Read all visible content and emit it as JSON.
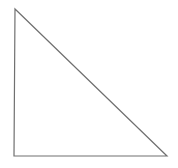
{
  "diagram": {
    "shape": "right-triangle",
    "stroke_color": "#707070",
    "fill_color": "#ffffff",
    "background": "#ffffff",
    "vertices": {
      "top": [
        15,
        9
      ],
      "bottom_left": [
        14,
        156
      ],
      "bottom_right": [
        167,
        156
      ]
    },
    "points": "15,9 14,156 167,156"
  }
}
